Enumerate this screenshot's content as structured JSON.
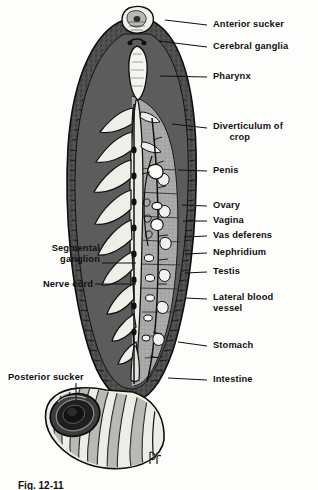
{
  "figure": {
    "caption": "Fig. 12-11",
    "signature": "artist-monogram"
  },
  "colors": {
    "ink": "#101010",
    "body_dark": "#4a4a4a",
    "body_mid": "#8d8d8d",
    "body_light": "#c9c9c9",
    "highlight": "#f2f2ee",
    "paper": "#fdfdfb"
  },
  "labels": {
    "right": [
      {
        "id": "anterior-sucker",
        "text": "Anterior sucker",
        "x": 213,
        "y": 24,
        "leader_x1": 207,
        "leader_y1": 28,
        "leader_x2": 165,
        "leader_y2": 21
      },
      {
        "id": "cerebral-ganglia",
        "text": "Cerebral ganglia",
        "x": 213,
        "y": 46,
        "leader_x1": 207,
        "leader_y1": 50,
        "leader_x2": 161,
        "leader_y2": 43
      },
      {
        "id": "pharynx",
        "text": "Pharynx",
        "x": 213,
        "y": 76,
        "leader_x1": 207,
        "leader_y1": 80,
        "leader_x2": 163,
        "leader_y2": 79
      },
      {
        "id": "diverticulum-of-crop",
        "text": "Diverticulum of\n      crop",
        "x": 213,
        "y": 126,
        "leader_x1": 207,
        "leader_y1": 131,
        "leader_x2": 170,
        "leader_y2": 126
      },
      {
        "id": "penis",
        "text": "Penis",
        "x": 213,
        "y": 170,
        "leader_x1": 207,
        "leader_y1": 174,
        "leader_x2": 174,
        "leader_y2": 172
      },
      {
        "id": "ovary",
        "text": "Ovary",
        "x": 213,
        "y": 205,
        "leader_x1": 207,
        "leader_y1": 209,
        "leader_x2": 176,
        "leader_y2": 208
      },
      {
        "id": "vagina",
        "text": "Vagina",
        "x": 213,
        "y": 220,
        "leader_x1": 207,
        "leader_y1": 224,
        "leader_x2": 177,
        "leader_y2": 223
      },
      {
        "id": "vas-deferens",
        "text": "Vas deferens",
        "x": 213,
        "y": 235,
        "leader_x1": 207,
        "leader_y1": 239,
        "leader_x2": 178,
        "leader_y2": 239
      },
      {
        "id": "nephridium",
        "text": "Nephridium",
        "x": 213,
        "y": 252,
        "leader_x1": 207,
        "leader_y1": 256,
        "leader_x2": 179,
        "leader_y2": 256
      },
      {
        "id": "testis",
        "text": "Testis",
        "x": 213,
        "y": 271,
        "leader_x1": 207,
        "leader_y1": 275,
        "leader_x2": 180,
        "leader_y2": 275
      },
      {
        "id": "lateral-blood-vessel",
        "text": "Lateral blood\nvessel",
        "x": 213,
        "y": 297,
        "leader_x1": 207,
        "leader_y1": 301,
        "leader_x2": 180,
        "leader_y2": 300
      },
      {
        "id": "stomach",
        "text": "Stomach",
        "x": 213,
        "y": 345,
        "leader_x1": 207,
        "leader_y1": 349,
        "leader_x2": 176,
        "leader_y2": 345
      },
      {
        "id": "intestine",
        "text": "Intestine",
        "x": 213,
        "y": 379,
        "leader_x1": 207,
        "leader_y1": 383,
        "leader_x2": 168,
        "leader_y2": 381
      }
    ],
    "left": [
      {
        "id": "segmental-ganglion",
        "text": "Segmental\nganglion",
        "x": 30,
        "y": 248,
        "leader_x1": 100,
        "leader_y1": 263,
        "leader_x2": 133,
        "leader_y2": 263
      },
      {
        "id": "nerve-cord",
        "text": "Nerve cord",
        "x": 30,
        "y": 280,
        "leader_x1": 92,
        "leader_y1": 284,
        "leader_x2": 133,
        "leader_y2": 284
      },
      {
        "id": "posterior-sucker",
        "text": "Posterior sucker",
        "x": 14,
        "y": 374,
        "leader_x1": 76,
        "leader_y1": 384,
        "leader_x2": 76,
        "leader_y2": 404
      }
    ]
  },
  "structures": [
    {
      "id": "anterior-sucker",
      "name": "Anterior sucker"
    },
    {
      "id": "cerebral-ganglia",
      "name": "Cerebral ganglia"
    },
    {
      "id": "pharynx",
      "name": "Pharynx"
    },
    {
      "id": "crop-diverticula",
      "name": "Diverticulum of crop"
    },
    {
      "id": "reproductive-organs",
      "name": "Reproductive organs"
    },
    {
      "id": "nerve-cord",
      "name": "Nerve cord"
    },
    {
      "id": "body-wall-annuli",
      "name": "Body wall annuli"
    },
    {
      "id": "posterior-sucker",
      "name": "Posterior sucker"
    }
  ]
}
